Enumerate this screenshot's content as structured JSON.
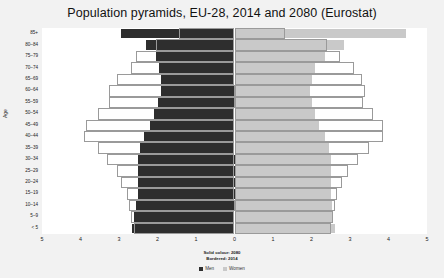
{
  "chart_data": {
    "type": "bar",
    "title": "Population pyramids, EU-28, 2014 and 2080 (Eurostat)",
    "subtype": "population-pyramid",
    "xlabel": "",
    "ylabel": "Age",
    "xlim": [
      -5,
      5
    ],
    "xticks": [
      5,
      4,
      3,
      2,
      1,
      0,
      1,
      2,
      3,
      4,
      5
    ],
    "xtick_values": [
      -5,
      -4,
      -3,
      -2,
      -1,
      0,
      1,
      2,
      3,
      4,
      5
    ],
    "grid": false,
    "legend_position": "bottom",
    "annotation": {
      "line1": "Solid colour: 2080",
      "line2": "Bordered: 2014"
    },
    "legend": [
      {
        "label": "Men",
        "color": "#2e2e2e"
      },
      {
        "label": "Women",
        "color": "#c9c9c9"
      }
    ],
    "categories": [
      "85+",
      "80–84",
      "75–79",
      "70–74",
      "65–69",
      "60–64",
      "55–59",
      "50–54",
      "45–49",
      "40–44",
      "35–39",
      "30–34",
      "25–29",
      "20–24",
      "15–19",
      "10–14",
      "5–9",
      "< 5"
    ],
    "series": [
      {
        "name": "Men 2080",
        "style": "solid",
        "side": "left",
        "color": "#2e2e2e",
        "values": [
          2.95,
          2.3,
          2.05,
          1.95,
          1.9,
          1.9,
          2.0,
          2.1,
          2.2,
          2.35,
          2.45,
          2.5,
          2.5,
          2.5,
          2.5,
          2.55,
          2.6,
          2.65
        ]
      },
      {
        "name": "Women 2080",
        "style": "solid",
        "side": "right",
        "color": "#c9c9c9",
        "values": [
          4.45,
          2.85,
          2.35,
          2.1,
          2.0,
          1.95,
          2.0,
          2.1,
          2.2,
          2.35,
          2.45,
          2.5,
          2.5,
          2.5,
          2.5,
          2.52,
          2.55,
          2.6
        ]
      },
      {
        "name": "Men 2014",
        "style": "bordered",
        "side": "left",
        "color": "#ffffff",
        "values": [
          1.45,
          2.05,
          2.55,
          2.7,
          3.05,
          3.25,
          3.25,
          3.55,
          3.85,
          3.9,
          3.55,
          3.3,
          3.05,
          2.95,
          2.8,
          2.75,
          2.7,
          2.6
        ]
      },
      {
        "name": "Women 2014",
        "style": "bordered",
        "side": "right",
        "color": "#ffffff",
        "values": [
          1.3,
          2.4,
          2.75,
          3.1,
          3.3,
          3.4,
          3.35,
          3.6,
          3.85,
          3.85,
          3.5,
          3.2,
          2.95,
          2.8,
          2.65,
          2.6,
          2.55,
          2.5
        ]
      }
    ]
  }
}
